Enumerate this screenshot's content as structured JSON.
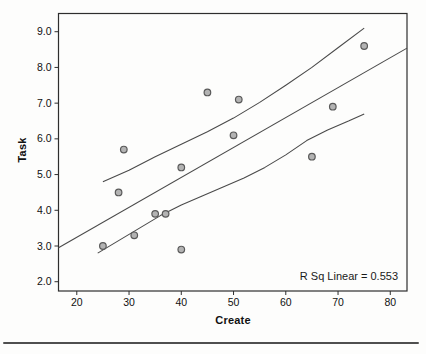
{
  "chart_data": {
    "type": "scatter",
    "title": "",
    "xlabel": "Create",
    "ylabel": "Task",
    "annotation": "R Sq Linear = 0.553",
    "r_squared": 0.553,
    "xlim": [
      16.5,
      83.2
    ],
    "ylim": [
      1.74,
      9.51
    ],
    "x_ticks": [
      "20",
      "30",
      "40",
      "50",
      "60",
      "70",
      "80"
    ],
    "y_ticks": [
      "2.0",
      "3.0",
      "4.0",
      "5.0",
      "6.0",
      "7.0",
      "8.0",
      "9.0"
    ],
    "grid": false,
    "legend": "none",
    "points": [
      [
        25,
        3.0
      ],
      [
        28,
        4.5
      ],
      [
        29,
        5.7
      ],
      [
        31,
        3.3
      ],
      [
        35,
        3.9
      ],
      [
        37,
        3.9
      ],
      [
        40,
        2.9
      ],
      [
        40,
        5.2
      ],
      [
        45,
        7.3
      ],
      [
        50,
        6.1
      ],
      [
        51,
        7.1
      ],
      [
        65,
        5.5
      ],
      [
        69,
        6.9
      ],
      [
        75,
        8.6
      ]
    ],
    "fit_line": {
      "x1": 16.5,
      "y1": 2.95,
      "x2": 83.2,
      "y2": 8.54
    },
    "upper_band": [
      [
        25,
        4.8
      ],
      [
        30,
        5.12
      ],
      [
        35,
        5.5
      ],
      [
        40,
        5.85
      ],
      [
        45,
        6.2
      ],
      [
        50,
        6.58
      ],
      [
        55,
        7.02
      ],
      [
        60,
        7.5
      ],
      [
        65,
        8.0
      ],
      [
        70,
        8.55
      ],
      [
        75,
        9.1
      ]
    ],
    "lower_band": [
      [
        24,
        2.8
      ],
      [
        28,
        3.15
      ],
      [
        32,
        3.5
      ],
      [
        36,
        3.85
      ],
      [
        40,
        4.15
      ],
      [
        44,
        4.4
      ],
      [
        48,
        4.65
      ],
      [
        52,
        4.9
      ],
      [
        56,
        5.2
      ],
      [
        60,
        5.55
      ],
      [
        64,
        5.95
      ],
      [
        68,
        6.25
      ],
      [
        72,
        6.5
      ],
      [
        75,
        6.7
      ]
    ],
    "colors": {
      "line": "#4a4a4a",
      "frame": "#2e2e2e",
      "point_fill": "#b3b3b3",
      "point_stroke": "#595959",
      "text": "#111111",
      "background": "#fdfdfc",
      "separator": "#4f4f4f"
    }
  }
}
